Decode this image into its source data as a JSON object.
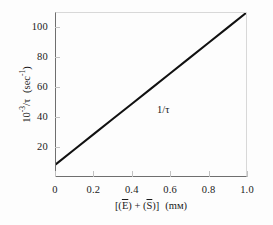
{
  "chart_data": {
    "type": "line",
    "title": "",
    "subtitle": "",
    "xlabel": "[(E) + (S)]  (mм)",
    "ylabel": "10-3/τ  (sec-1)",
    "xlim": [
      0,
      1.0
    ],
    "ylim": [
      0,
      110
    ],
    "grid": false,
    "legend": "none",
    "x_ticks": [
      "0",
      "0.2",
      "0.4",
      "0.6",
      "0.8",
      "1.0"
    ],
    "x_tick_values": [
      0,
      0.2,
      0.4,
      0.6,
      0.8,
      1.0
    ],
    "y_ticks": [
      "20",
      "40",
      "60",
      "80",
      "100"
    ],
    "y_tick_values": [
      20,
      40,
      60,
      80,
      100
    ],
    "series": [
      {
        "name": "1/τ",
        "x": [
          0.0,
          0.1,
          0.2,
          0.3,
          0.4,
          0.5,
          0.6,
          0.7,
          0.8,
          0.9,
          1.0
        ],
        "values": [
          8,
          18.2,
          28.4,
          38.6,
          48.8,
          59,
          69.2,
          79.4,
          89.6,
          99.8,
          110
        ],
        "color": "#111111",
        "annotation": "1/τ",
        "annotation_x": 0.5,
        "annotation_y": 52
      }
    ]
  },
  "axis_titles": {
    "y_prefix": "10",
    "y_exponent": "-3",
    "y_mid": "/τ",
    "y_unit_open": "(sec",
    "y_unit_exponent": "-1",
    "y_unit_close": ")",
    "x_bracket_open": "[(",
    "x_symbol_e": "E",
    "x_close_plus": ") + (",
    "x_symbol_s": "S",
    "x_bracket_close": ")]",
    "x_unit": "(mм)"
  },
  "colors": {
    "line": "#111111",
    "frame_dark": "#6f6f6f",
    "frame_light": "#d8d8d8",
    "tick": "#c2c2c2",
    "text": "#1a1a1a",
    "background": "#fdfdfd"
  }
}
